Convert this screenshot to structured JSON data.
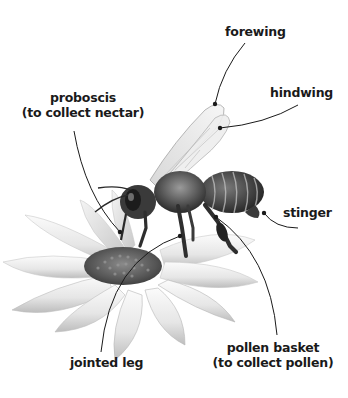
{
  "diagram": {
    "colors": {
      "background": "#ffffff",
      "label_text": "#1a1a1a",
      "leader_line": "#1a1a1a"
    },
    "labels": [
      {
        "id": "forewing",
        "lines": [
          "forewing"
        ]
      },
      {
        "id": "hindwing",
        "lines": [
          "hindwing"
        ]
      },
      {
        "id": "proboscis",
        "lines": [
          "proboscis",
          "(to collect nectar)"
        ]
      },
      {
        "id": "stinger",
        "lines": [
          "stinger"
        ]
      },
      {
        "id": "pollen_basket",
        "lines": [
          "pollen basket",
          "(to collect pollen)"
        ]
      },
      {
        "id": "jointed_leg",
        "lines": [
          "jointed leg"
        ]
      }
    ]
  }
}
